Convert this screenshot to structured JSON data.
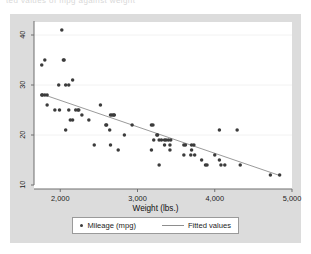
{
  "top_clipped_text": "ted values of mpg against weight",
  "colors": {
    "canvas_background": "#dcdcdc",
    "plot_background": "#ffffff",
    "marker": "#3b3b3b",
    "fit_line": "#8e8e8e",
    "axis": "#6f6f6f",
    "gridline": "#f2f2f2",
    "text": "#1c1c1c"
  },
  "legend": {
    "series": [
      {
        "label": "Mileage (mpg)",
        "marker": "dot",
        "color": "#3b3b3b"
      },
      {
        "label": "Fitted values",
        "marker": "line",
        "color": "#8e8e8e"
      }
    ]
  },
  "chart_data": {
    "type": "scatter",
    "title": "",
    "subtitle": "",
    "xlabel": "Weight (lbs.)",
    "ylabel": "",
    "xlim": [
      1660,
      5000
    ],
    "ylim": [
      9.2,
      42.6
    ],
    "xticks": [
      2000,
      3000,
      4000,
      5000
    ],
    "xticklabels": [
      "2,000",
      "3,000",
      "4,000",
      "5,000"
    ],
    "yticks": [
      10,
      20,
      30,
      40
    ],
    "yticklabels": [
      "10",
      "20",
      "30",
      "40"
    ],
    "grid": {
      "horizontal": true,
      "vertical": false
    },
    "legend_position": "bottom",
    "series": [
      {
        "name": "Mileage (mpg)",
        "type": "scatter",
        "marker": "circle",
        "color": "#3b3b3b",
        "points": [
          [
            2020,
            41
          ],
          [
            1800,
            35
          ],
          [
            2050,
            35
          ],
          [
            2040,
            35
          ],
          [
            1760,
            34
          ],
          [
            1980,
            30
          ],
          [
            2160,
            31
          ],
          [
            2070,
            30
          ],
          [
            2110,
            30
          ],
          [
            1800,
            28
          ],
          [
            1770,
            28
          ],
          [
            1830,
            28
          ],
          [
            1760,
            28
          ],
          [
            2520,
            26
          ],
          [
            1830,
            26
          ],
          [
            2230,
            25
          ],
          [
            2240,
            25
          ],
          [
            1930,
            25
          ],
          [
            1990,
            25
          ],
          [
            2110,
            25
          ],
          [
            2200,
            25
          ],
          [
            2670,
            24
          ],
          [
            2690,
            24
          ],
          [
            2700,
            24
          ],
          [
            2650,
            24
          ],
          [
            2280,
            24
          ],
          [
            2160,
            23
          ],
          [
            2130,
            23
          ],
          [
            2370,
            23
          ],
          [
            2930,
            22
          ],
          [
            2590,
            22
          ],
          [
            2600,
            22
          ],
          [
            3180,
            22
          ],
          [
            3200,
            22
          ],
          [
            2640,
            21
          ],
          [
            2070,
            21
          ],
          [
            4060,
            21
          ],
          [
            4290,
            21
          ],
          [
            2830,
            20
          ],
          [
            3260,
            20
          ],
          [
            3250,
            20
          ],
          [
            3210,
            19
          ],
          [
            3350,
            19
          ],
          [
            3370,
            19
          ],
          [
            3400,
            19
          ],
          [
            3430,
            19
          ],
          [
            3280,
            19
          ],
          [
            3310,
            19
          ],
          [
            3420,
            18
          ],
          [
            3600,
            18
          ],
          [
            3620,
            18
          ],
          [
            3700,
            18
          ],
          [
            3730,
            18
          ],
          [
            2440,
            18
          ],
          [
            2650,
            18
          ],
          [
            3350,
            18
          ],
          [
            2750,
            17
          ],
          [
            3180,
            17
          ],
          [
            3420,
            17
          ],
          [
            3700,
            17
          ],
          [
            3690,
            16
          ],
          [
            3600,
            16
          ],
          [
            3740,
            16
          ],
          [
            4000,
            16
          ],
          [
            3830,
            15
          ],
          [
            4060,
            15
          ],
          [
            3280,
            14
          ],
          [
            3880,
            14
          ],
          [
            3900,
            14
          ],
          [
            4080,
            14
          ],
          [
            4130,
            14
          ],
          [
            4330,
            14
          ],
          [
            4720,
            12
          ],
          [
            4840,
            12
          ]
        ]
      },
      {
        "name": "Fitted values",
        "type": "line",
        "color": "#8e8e8e",
        "points": [
          [
            1760,
            28.2
          ],
          [
            4840,
            11.9
          ]
        ]
      }
    ]
  }
}
